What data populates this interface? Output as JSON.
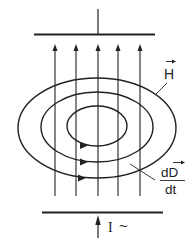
{
  "diagram": {
    "labels": {
      "magnetic_field": "H",
      "displacement_current_num": "dD",
      "displacement_current_den": "dt",
      "current": "I",
      "ac_symbol": "~"
    },
    "elements": {
      "plates": 2,
      "field_lines_vertical": 5,
      "magnetic_field_loops": 3
    },
    "colors": {
      "stroke": "#222222",
      "background": "#ffffff"
    }
  }
}
